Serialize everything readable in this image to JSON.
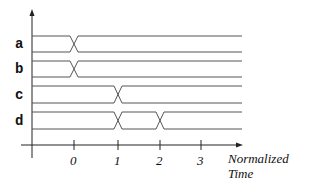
{
  "diagram": {
    "type": "timing-diagram",
    "signals": [
      {
        "name": "a",
        "transitions_at": [
          0
        ]
      },
      {
        "name": "b",
        "transitions_at": [
          0
        ]
      },
      {
        "name": "c",
        "transitions_at": [
          1
        ]
      },
      {
        "name": "d",
        "transitions_at": [
          1,
          2
        ]
      }
    ],
    "x_axis": {
      "ticks": [
        "0",
        "1",
        "2",
        "3"
      ],
      "title_line1": "Normalized",
      "title_line2": "Time"
    },
    "colors": {
      "waveform": "#555555",
      "axis": "#222222",
      "text": "#111111"
    }
  }
}
